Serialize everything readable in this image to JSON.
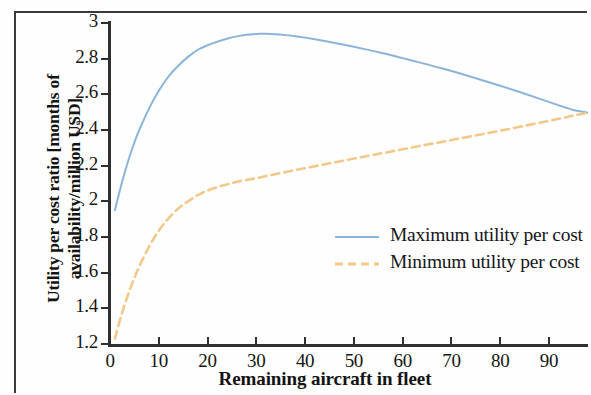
{
  "chart_data": {
    "type": "line",
    "title": "",
    "xlabel": "Remaining aircraft in fleet",
    "ylabel": "Utility per cost ratio [months of availability/million USD]",
    "ylabel_line1": "Utility per cost ratio [months of",
    "ylabel_line2": "availability/million USD]",
    "xlim": [
      0,
      98
    ],
    "ylim": [
      1.2,
      3
    ],
    "xticks": [
      0,
      10,
      20,
      30,
      40,
      50,
      60,
      70,
      80,
      90
    ],
    "xtick_labels": [
      "0",
      "10",
      "20",
      "30",
      "40",
      "50",
      "60",
      "70",
      "80",
      "90"
    ],
    "yticks": [
      1.2,
      1.4,
      1.6,
      1.8,
      2,
      2.2,
      2.4,
      2.6,
      2.8,
      3
    ],
    "ytick_labels": [
      "1.2",
      "1.4",
      "1.6",
      "1.8",
      "2",
      "2.2",
      "2.4",
      "2.6",
      "2.8",
      "3"
    ],
    "grid": false,
    "legend_position": "center-right",
    "series": [
      {
        "name": "Maximum utility per cost",
        "color": "#8bb4d8",
        "style": "solid",
        "x": [
          1,
          2,
          3,
          4,
          5,
          6,
          8,
          10,
          12,
          14,
          16,
          18,
          20,
          22,
          24,
          26,
          28,
          30,
          31,
          32,
          34,
          36,
          38,
          40,
          44,
          48,
          52,
          56,
          60,
          64,
          68,
          72,
          76,
          80,
          84,
          88,
          92,
          95,
          98
        ],
        "values": [
          1.95,
          2.06,
          2.16,
          2.25,
          2.33,
          2.4,
          2.52,
          2.62,
          2.7,
          2.76,
          2.81,
          2.85,
          2.875,
          2.895,
          2.912,
          2.925,
          2.934,
          2.939,
          2.94,
          2.94,
          2.937,
          2.932,
          2.926,
          2.918,
          2.899,
          2.878,
          2.855,
          2.83,
          2.803,
          2.775,
          2.746,
          2.715,
          2.682,
          2.648,
          2.613,
          2.576,
          2.538,
          2.512,
          2.497
        ]
      },
      {
        "name": "Minimum utility per cost",
        "color": "#f2c98a",
        "style": "dashed",
        "x": [
          1,
          2,
          3,
          4,
          5,
          6,
          8,
          10,
          12,
          14,
          16,
          18,
          20,
          22,
          24,
          26,
          28,
          30,
          32,
          34,
          36,
          38,
          40,
          44,
          48,
          52,
          56,
          60,
          64,
          68,
          72,
          76,
          80,
          84,
          88,
          92,
          95,
          98
        ],
        "values": [
          1.23,
          1.33,
          1.42,
          1.5,
          1.57,
          1.635,
          1.745,
          1.835,
          1.905,
          1.96,
          2.0,
          2.035,
          2.06,
          2.08,
          2.095,
          2.11,
          2.12,
          2.13,
          2.142,
          2.153,
          2.164,
          2.175,
          2.186,
          2.208,
          2.229,
          2.25,
          2.271,
          2.292,
          2.313,
          2.333,
          2.354,
          2.375,
          2.396,
          2.418,
          2.44,
          2.463,
          2.481,
          2.497
        ]
      }
    ],
    "legend": [
      {
        "label": "Maximum utility per cost",
        "color": "#8bb4d8",
        "style": "solid"
      },
      {
        "label": "Minimum utility per cost",
        "color": "#f2c98a",
        "style": "dashed"
      }
    ],
    "colors": {
      "axis": "#2f2f2d",
      "text": "#161614",
      "background": "#fefefe",
      "frame": "#3a3a38"
    }
  }
}
